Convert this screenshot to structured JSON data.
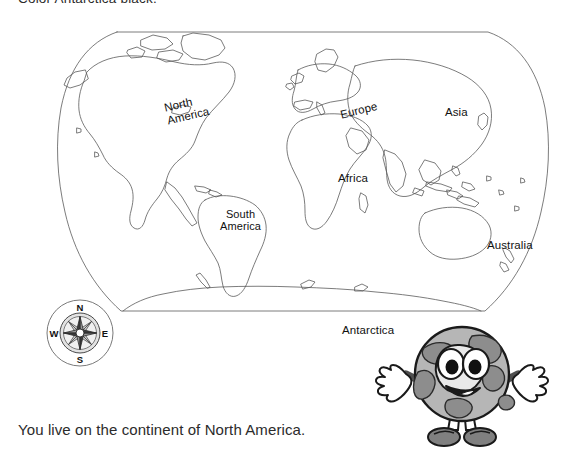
{
  "page": {
    "kind": "worksheet",
    "background_color": "#ffffff",
    "ink_color": "#1a1a1a"
  },
  "instruction_top": {
    "text": "Color Antarctica black.",
    "clipped_at_top": true
  },
  "sentence_bottom": {
    "text": "You live on the continent of North America."
  },
  "map": {
    "projection": "robinson",
    "outline_color": "#555555",
    "fill_color": "#ffffff",
    "labels": [
      {
        "id": "north-america",
        "line1": "North",
        "line2": "America",
        "rotated": true
      },
      {
        "id": "south-america",
        "line1": "South",
        "line2": "America",
        "rotated": false
      },
      {
        "id": "europe",
        "line1": "Europe",
        "line2": "",
        "rotated": true
      },
      {
        "id": "asia",
        "line1": "Asia",
        "line2": "",
        "rotated": false
      },
      {
        "id": "africa",
        "line1": "Africa",
        "line2": "",
        "rotated": false
      },
      {
        "id": "australia",
        "line1": "Australia",
        "line2": "",
        "rotated": false
      },
      {
        "id": "antarctica",
        "line1": "Antarctica",
        "line2": "",
        "rotated": false
      }
    ]
  },
  "compass": {
    "north": "N",
    "east": "E",
    "south": "S",
    "west": "W",
    "ring_color": "#4a4a4a",
    "star_color": "#3a3a3a"
  },
  "mascot": {
    "name": "smiling-globe-character",
    "body_color": "#b4b4b4",
    "land_color": "#8f8f8f",
    "eye_color": "#ffffff",
    "pupil_color": "#111111",
    "glove_color": "#ffffff",
    "shoe_color": "#777777",
    "outline_color": "#1a1a1a"
  }
}
